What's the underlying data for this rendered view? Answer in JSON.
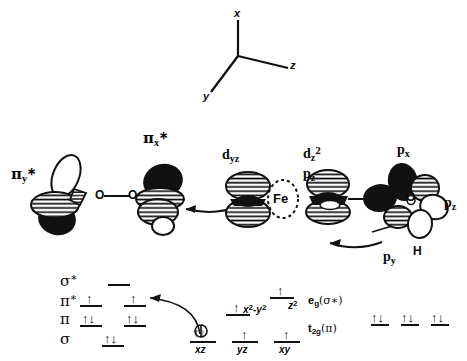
{
  "figure": {
    "type": "diagram",
    "background_color": "#ffffff",
    "ink_color": "#111111"
  },
  "axes": {
    "label_x": "x",
    "label_y": "y",
    "label_z": "z"
  },
  "orbitals": [
    {
      "name": "pi-y-star",
      "greek": "π",
      "sub": "y",
      "sup": "∗",
      "text": "π*y"
    },
    {
      "name": "pi-x-star",
      "greek": "π",
      "sub": "x",
      "sup": "∗",
      "text": "π*x"
    },
    {
      "name": "d-yz",
      "base": "d",
      "sub": "yz",
      "text": "dyz"
    },
    {
      "name": "d-z2",
      "base": "d",
      "sub": "z",
      "sup": "2",
      "text": "dz2"
    },
    {
      "name": "p-z-center",
      "base": "p",
      "sub": "z",
      "text": "pz"
    },
    {
      "name": "p-x",
      "base": "p",
      "sub": "x",
      "text": "px"
    },
    {
      "name": "p-y",
      "base": "p",
      "sub": "y",
      "text": "py"
    },
    {
      "name": "p-z-right",
      "base": "p",
      "sub": "z",
      "text": "pz"
    }
  ],
  "atoms": {
    "oxygen_left": "O",
    "oxygen_mid": "O",
    "iron": "Fe",
    "oxygen_right": "O",
    "hydrogen": "H"
  },
  "mo_diagram": {
    "rows": [
      {
        "name": "sigma-star",
        "greek": "σ",
        "sup": "∗",
        "label": "σ*",
        "levels": [
          {
            "x": 118,
            "electrons": ""
          }
        ]
      },
      {
        "name": "pi-star",
        "greek": "π",
        "sup": "∗",
        "label": "π*",
        "levels": [
          {
            "x": 88,
            "electrons": "↑"
          },
          {
            "x": 132,
            "electrons": "↑"
          }
        ]
      },
      {
        "name": "pi",
        "greek": "π",
        "sup": "",
        "label": "π",
        "levels": [
          {
            "x": 88,
            "electrons": "↑↓"
          },
          {
            "x": 132,
            "electrons": "↑↓"
          }
        ]
      },
      {
        "name": "sigma",
        "greek": "σ",
        "sup": "",
        "label": "σ",
        "levels": [
          {
            "x": 110,
            "electrons": "↑↓"
          }
        ]
      }
    ],
    "d_levels_upper": [
      {
        "name": "d-z2-level",
        "label": "z",
        "sup": "2",
        "electrons": "↑",
        "x": 278,
        "y": 300
      },
      {
        "name": "d-x2y2-level",
        "label": "x",
        "sup": "2",
        "label2": "-y",
        "sup2": "2",
        "electrons": "↑",
        "x": 232,
        "y": 300
      }
    ],
    "d_levels_lower": [
      {
        "name": "d-xz-level",
        "label": "xz",
        "electrons": "↑↓",
        "x": 198
      },
      {
        "name": "d-yz-level",
        "label": "yz",
        "electrons": "↑",
        "x": 240
      },
      {
        "name": "d-xy-level",
        "label": "xy",
        "electrons": "↑",
        "x": 282
      }
    ],
    "term_labels": [
      {
        "name": "eg-label",
        "main": "e",
        "sub": "g",
        "paren": "(σ*)"
      },
      {
        "name": "t2g-label",
        "main": "t",
        "sub": "2g",
        "paren": "(π)"
      }
    ],
    "right_levels": [
      {
        "name": "right-level-1",
        "electrons": "↑↓",
        "x": 376
      },
      {
        "name": "right-level-2",
        "electrons": "↑↓",
        "x": 406
      },
      {
        "name": "right-level-3",
        "electrons": "↑↓",
        "x": 436
      }
    ]
  },
  "annotations": {
    "arrow_to_dyz": "curved-arrow-left",
    "arrow_to_ferryl": "curved-arrow-left",
    "arrow_xz_to_pistar": "curved-arrow-long-left"
  }
}
